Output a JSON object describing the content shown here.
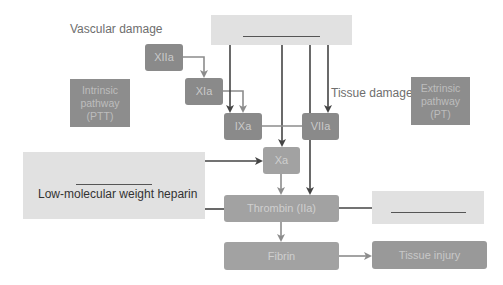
{
  "diagram": {
    "labels": {
      "vascular_damage": "Vascular damage",
      "tissue_damage": "Tissue damage"
    },
    "factors": {
      "xiia": "XIIa",
      "xia": "XIa",
      "ixa": "IXa",
      "viia": "VIIa",
      "xa": "Xa",
      "thrombin": "Thrombin (IIa)",
      "fibrin": "Fibrin",
      "tissue_injury": "Tissue injury"
    },
    "pathways": {
      "intrinsic": [
        "Intrinsic",
        "pathway",
        "(PTT)"
      ],
      "extrinsic": [
        "Extrinsic",
        "pathway",
        "(PT)"
      ]
    },
    "drug_boxes": {
      "top_blank": "",
      "left_blank": "",
      "left_drug": "Low-molecular weight heparin",
      "right_blank": ""
    },
    "colors": {
      "dark_box": "#8a8a8a",
      "light_box": "#a2a2a2",
      "drug_box": "#e1e1e1",
      "dark_arrow": "#444444",
      "light_arrow": "#8c8c8c"
    }
  }
}
